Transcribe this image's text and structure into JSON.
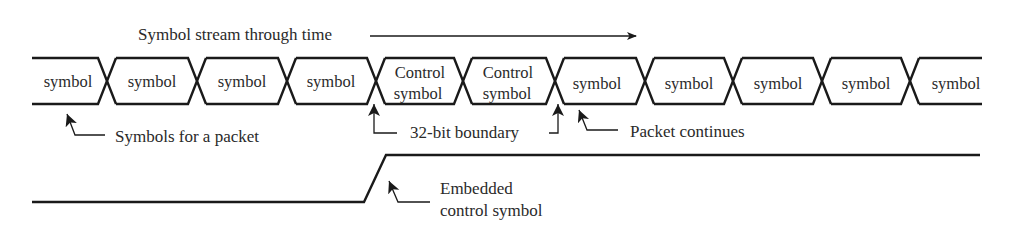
{
  "title": "Symbol stream through time",
  "symbols": [
    {
      "line1": "symbol",
      "line2": ""
    },
    {
      "line1": "symbol",
      "line2": ""
    },
    {
      "line1": "symbol",
      "line2": ""
    },
    {
      "line1": "symbol",
      "line2": ""
    },
    {
      "line1": "Control",
      "line2": "symbol"
    },
    {
      "line1": "Control",
      "line2": "symbol"
    },
    {
      "line1": "symbol",
      "line2": ""
    },
    {
      "line1": "symbol",
      "line2": ""
    },
    {
      "line1": "symbol",
      "line2": ""
    },
    {
      "line1": "symbol",
      "line2": ""
    },
    {
      "line1": "symbol",
      "line2": ""
    }
  ],
  "annotations": {
    "packet_symbols": "Symbols for a packet",
    "boundary": "32-bit boundary",
    "packet_continues": "Packet continues",
    "embedded_line1": "Embedded",
    "embedded_line2": "control symbol"
  },
  "colors": {
    "stroke": "#1a1a1a",
    "text": "#2a2a2a",
    "background": "#ffffff"
  }
}
